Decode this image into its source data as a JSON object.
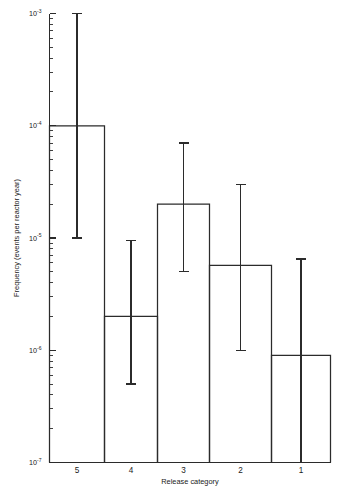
{
  "chart_data": {
    "type": "bar",
    "title": "",
    "subtitle": "",
    "xlabel": "Release category",
    "ylabel": "Frequency (events per reactor year)",
    "categories": [
      "5",
      "4",
      "3",
      "2",
      "1"
    ],
    "values": [
      0.0001,
      2e-06,
      2e-05,
      5.7e-06,
      9e-07
    ],
    "error_high": [
      0.001,
      9.5e-06,
      7e-05,
      3e-05,
      6.5e-06
    ],
    "error_low": [
      1e-05,
      5e-07,
      5e-06,
      1e-06,
      1e-07
    ],
    "yscale": "log",
    "ylim": [
      1e-07,
      0.001
    ],
    "xscale": "linear",
    "grid": false,
    "legend": false,
    "legend_position": "none",
    "ytick_labels": [
      "10-3",
      "10-4",
      "10-5",
      "10-6",
      "10-7"
    ],
    "ytick_values": [
      0.001,
      0.0001,
      1e-05,
      1e-06,
      1e-07
    ],
    "ytick_mantissas": [
      "10",
      "10",
      "10",
      "10",
      "10"
    ],
    "ytick_exponents": [
      "-3",
      "-4",
      "-5",
      "-6",
      "-7"
    ],
    "minor_ticks": [
      2,
      3,
      4,
      5,
      6,
      7,
      8,
      9
    ],
    "series": [
      {
        "name": "Frequency",
        "values": [
          0.0001,
          2e-06,
          2e-05,
          5.7e-06,
          9e-07
        ]
      }
    ],
    "bars": [
      {
        "category": "5",
        "value": 0.0001,
        "err_high": 0.001,
        "err_low": 1e-05
      },
      {
        "category": "4",
        "value": 2e-06,
        "err_high": 9.5e-06,
        "err_low": 5e-07
      },
      {
        "category": "3",
        "value": 2e-05,
        "err_high": 7e-05,
        "err_low": 5e-06
      },
      {
        "category": "2",
        "value": 5.7e-06,
        "err_high": 3e-05,
        "err_low": 1e-06
      },
      {
        "category": "1",
        "value": 9e-07,
        "err_high": 6.5e-06,
        "err_low": 1e-07
      }
    ],
    "colors": {
      "ink": "#2b2b2b",
      "background": "#ffffff",
      "bar_fill": "none",
      "bar_stroke": "#2b2b2b"
    }
  }
}
